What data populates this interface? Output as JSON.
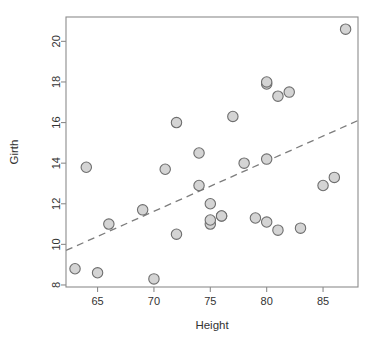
{
  "chart_data": {
    "type": "scatter",
    "title": "",
    "xlabel": "Height",
    "ylabel": "Girth",
    "xlim": [
      62.2,
      88.1
    ],
    "ylim": [
      7.9,
      21.2
    ],
    "xticks": [
      65,
      70,
      75,
      80,
      85
    ],
    "yticks": [
      8,
      10,
      12,
      14,
      16,
      18,
      20
    ],
    "grid": false,
    "legend": null,
    "series": [
      {
        "name": "trees",
        "marker": "circle",
        "marker_fill": "#d4d4d4",
        "marker_stroke": "#6e6e6e",
        "points": [
          {
            "x": 70,
            "y": 8.3
          },
          {
            "x": 65,
            "y": 8.6
          },
          {
            "x": 63,
            "y": 8.8
          },
          {
            "x": 72,
            "y": 10.5
          },
          {
            "x": 81,
            "y": 10.7
          },
          {
            "x": 83,
            "y": 10.8
          },
          {
            "x": 66,
            "y": 11.0
          },
          {
            "x": 75,
            "y": 11.0
          },
          {
            "x": 80,
            "y": 11.1
          },
          {
            "x": 75,
            "y": 11.2
          },
          {
            "x": 79,
            "y": 11.3
          },
          {
            "x": 76,
            "y": 11.4
          },
          {
            "x": 76,
            "y": 11.4
          },
          {
            "x": 69,
            "y": 11.7
          },
          {
            "x": 75,
            "y": 12.0
          },
          {
            "x": 74,
            "y": 12.9
          },
          {
            "x": 85,
            "y": 12.9
          },
          {
            "x": 86,
            "y": 13.3
          },
          {
            "x": 71,
            "y": 13.7
          },
          {
            "x": 64,
            "y": 13.8
          },
          {
            "x": 78,
            "y": 14.0
          },
          {
            "x": 80,
            "y": 14.2
          },
          {
            "x": 74,
            "y": 14.5
          },
          {
            "x": 72,
            "y": 16.0
          },
          {
            "x": 77,
            "y": 16.3
          },
          {
            "x": 81,
            "y": 17.3
          },
          {
            "x": 82,
            "y": 17.5
          },
          {
            "x": 80,
            "y": 17.9
          },
          {
            "x": 80,
            "y": 18.0
          },
          {
            "x": 87,
            "y": 20.6
          }
        ]
      }
    ],
    "fit_line": {
      "style": "dashed",
      "color": "#7d7d7d",
      "x_start": 62.2,
      "y_start": 9.7,
      "x_end": 88.1,
      "y_end": 16.1
    }
  },
  "axes": {
    "x_label": "Height",
    "y_label": "Girth",
    "x_tick_labels": [
      "65",
      "70",
      "75",
      "80",
      "85"
    ],
    "y_tick_labels": [
      "8",
      "10",
      "12",
      "14",
      "16",
      "18",
      "20"
    ]
  },
  "colors": {
    "background": "#ffffff",
    "frame": "#8c8c8c",
    "text": "#333333",
    "point_fill": "#d4d4d4",
    "point_stroke": "#6e6e6e",
    "fit_line": "#7d7d7d"
  }
}
